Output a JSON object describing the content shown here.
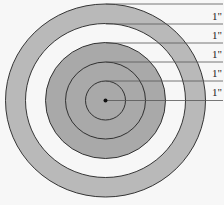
{
  "diagram": {
    "type": "concentric-target",
    "center": {
      "x": 105.5,
      "y": 100.5
    },
    "rings": [
      {
        "name": "outer-ring",
        "r_outer": 100,
        "color": "#b9b9b9"
      },
      {
        "name": "white-ring",
        "r_outer": 80,
        "color": "#f7f7f7"
      },
      {
        "name": "inner-disk",
        "r_outer": 60,
        "color": "#a9a9a9"
      }
    ],
    "circle_radii": [
      20,
      40,
      60,
      80,
      100
    ],
    "labels": [
      "1\"",
      "1\"",
      "1\"",
      "1\"",
      "1\""
    ],
    "label_y": [
      20,
      39,
      58,
      77,
      96
    ],
    "line_y": [
      4,
      24,
      43,
      62,
      81,
      100
    ],
    "colors": {
      "stroke": "#222222",
      "guide": "#555555",
      "background": "#f7f7f7"
    }
  }
}
